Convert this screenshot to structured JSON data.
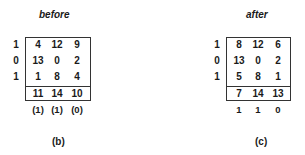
{
  "panels": [
    {
      "id": "b",
      "title": "before",
      "caption": "(b)",
      "row_labels": [
        "1",
        "0",
        "1"
      ],
      "matrix": [
        [
          "4",
          "12",
          "9"
        ],
        [
          "13",
          "0",
          "2"
        ],
        [
          "1",
          "8",
          "4"
        ]
      ],
      "totals": [
        "11",
        "14",
        "10"
      ],
      "bottom_labels": [
        "(1)",
        "(1)",
        "(0)"
      ]
    },
    {
      "id": "c",
      "title": "after",
      "caption": "(c)",
      "row_labels": [
        "1",
        "0",
        "1"
      ],
      "matrix": [
        [
          "8",
          "12",
          "6"
        ],
        [
          "13",
          "0",
          "2"
        ],
        [
          "5",
          "8",
          "1"
        ]
      ],
      "totals": [
        "7",
        "14",
        "13"
      ],
      "bottom_labels": [
        "1",
        "1",
        "0"
      ]
    }
  ]
}
